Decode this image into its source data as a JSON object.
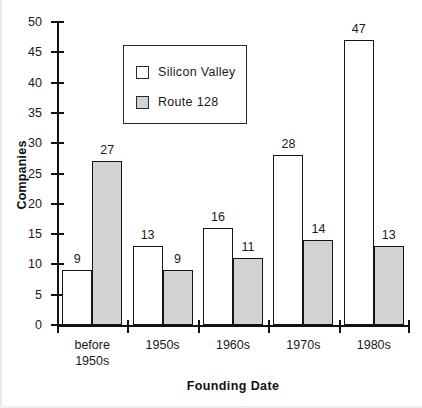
{
  "chart_data": {
    "type": "bar",
    "title": "",
    "subtitle": "",
    "xlabel": "Founding  Date",
    "ylabel": "Companies",
    "categories": [
      "before\n1950s",
      "1950s",
      "1960s",
      "1970s",
      "1980s"
    ],
    "category_labels": [
      {
        "line1": "before",
        "line2": "1950s"
      },
      {
        "line1": "1950s",
        "line2": ""
      },
      {
        "line1": "1960s",
        "line2": ""
      },
      {
        "line1": "1970s",
        "line2": ""
      },
      {
        "line1": "1980s",
        "line2": ""
      }
    ],
    "series": [
      {
        "name": "Silicon  Valley",
        "values": [
          9,
          13,
          16,
          28,
          47
        ],
        "color": "#ffffff"
      },
      {
        "name": "Route  128",
        "values": [
          27,
          9,
          11,
          14,
          13
        ],
        "color": "#d2d2d2"
      }
    ],
    "ylim": [
      0,
      50
    ],
    "ytick_labels": [
      "0",
      "5",
      "10",
      "15",
      "20",
      "25",
      "30",
      "35",
      "40",
      "45",
      "50"
    ],
    "ytick_values": [
      0,
      5,
      10,
      15,
      20,
      25,
      30,
      35,
      40,
      45,
      50
    ],
    "grid": false,
    "legend_position": "upper-left-inside",
    "show_data_labels": true,
    "axis_color": "#111111",
    "bar_edge_color": "#151515"
  }
}
